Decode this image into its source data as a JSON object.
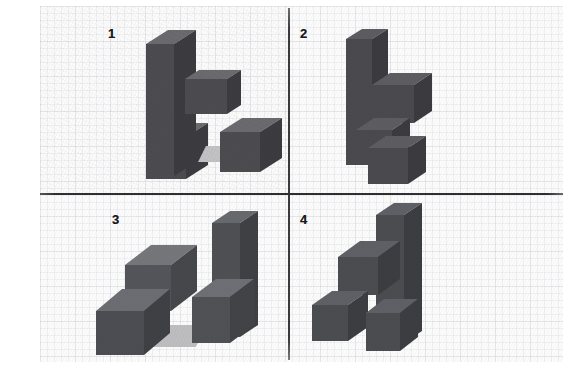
{
  "figure": {
    "background_color": "#fbfbfb",
    "divider_color": "#333335",
    "block_fill": "#4c4c50",
    "block_top_fill": "#6a6a6f",
    "block_side_fill": "#3c3c40",
    "shadow_fill": "#b9b9bc"
  },
  "layout": {
    "columns": 2,
    "rows": 2,
    "vertical_divider_x": 288,
    "horizontal_divider_y": 193
  },
  "panels": [
    {
      "label": "1",
      "name": "panel-1",
      "block_count": 4,
      "blocks": [
        {
          "name": "tall-column",
          "kind": "tall-prism",
          "position": "upper-left"
        },
        {
          "name": "floating-cube",
          "kind": "cube",
          "position": "middle-right"
        },
        {
          "name": "base-cube",
          "kind": "cube",
          "position": "bottom-left"
        },
        {
          "name": "detached-cube",
          "kind": "cube",
          "position": "bottom-right"
        }
      ],
      "has_shadow": true
    },
    {
      "label": "2",
      "name": "panel-2",
      "block_count": 4,
      "blocks": [
        {
          "name": "tall-column",
          "kind": "tall-prism",
          "position": "upper-left"
        },
        {
          "name": "arm-cube",
          "kind": "cube",
          "position": "middle-right"
        },
        {
          "name": "lower-cube",
          "kind": "cube",
          "position": "bottom-center"
        },
        {
          "name": "bottom-cube",
          "kind": "cube",
          "position": "bottom-right"
        }
      ],
      "has_shadow": false
    },
    {
      "label": "3",
      "name": "panel-3",
      "block_count": 4,
      "blocks": [
        {
          "name": "tall-column",
          "kind": "tall-prism",
          "position": "right"
        },
        {
          "name": "upper-cube",
          "kind": "cube",
          "position": "center"
        },
        {
          "name": "lower-left-cube",
          "kind": "cube",
          "position": "bottom-left"
        },
        {
          "name": "column-base-cube",
          "kind": "cube",
          "position": "bottom-right"
        }
      ],
      "has_shadow": true
    },
    {
      "label": "4",
      "name": "panel-4",
      "block_count": 4,
      "blocks": [
        {
          "name": "tall-column",
          "kind": "tall-prism",
          "position": "right"
        },
        {
          "name": "arm-cube",
          "kind": "cube",
          "position": "middle-left"
        },
        {
          "name": "bottom-left-cube",
          "kind": "cube",
          "position": "bottom-left"
        },
        {
          "name": "column-base-cube",
          "kind": "cube",
          "position": "bottom-right"
        }
      ],
      "has_shadow": true
    }
  ]
}
